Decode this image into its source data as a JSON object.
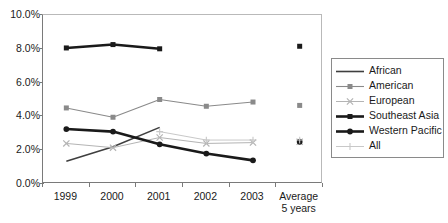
{
  "chart_data": {
    "type": "line",
    "title": "",
    "subtitle": "",
    "xlabel": "",
    "ylabel": "",
    "grid": false,
    "legend_position": "right",
    "categories": [
      "1999",
      "2000",
      "2001",
      "2002",
      "2003",
      "Average 5 years"
    ],
    "category_lines": [
      [
        "1999"
      ],
      [
        "2000"
      ],
      [
        "2001"
      ],
      [
        "2002"
      ],
      [
        "2003"
      ],
      [
        "Average",
        "5 years"
      ]
    ],
    "ylim": [
      0.0,
      10.0
    ],
    "ytick_values": [
      0.0,
      2.0,
      4.0,
      6.0,
      8.0,
      10.0
    ],
    "ytick_labels": [
      "0.0%",
      "2.0%",
      "4.0%",
      "6.0%",
      "8.0%",
      "10.0%"
    ],
    "series": [
      {
        "name": "African",
        "color": "#3f3f3f",
        "width": 1.6,
        "marker": "none",
        "values": [
          1.35,
          2.2,
          3.35,
          null,
          null,
          null
        ]
      },
      {
        "name": "American",
        "color": "#8a8a8a",
        "width": 1.1,
        "marker": "square",
        "values": [
          4.5,
          3.95,
          5.0,
          4.6,
          4.85,
          4.65
        ]
      },
      {
        "name": "European",
        "color": "#b4b4b4",
        "width": 1.0,
        "marker": "cross",
        "values": [
          2.4,
          2.15,
          2.75,
          2.4,
          2.45,
          2.5
        ]
      },
      {
        "name": "Southeast Asia",
        "color": "#1a1a1a",
        "width": 2.6,
        "marker": "square",
        "values": [
          8.05,
          8.25,
          8.0,
          null,
          null,
          8.15
        ]
      },
      {
        "name": "Western Pacific",
        "color": "#1a1a1a",
        "width": 2.6,
        "marker": "circle",
        "values": [
          3.25,
          3.1,
          2.35,
          1.8,
          1.4,
          2.5
        ]
      },
      {
        "name": "All",
        "color": "#c8c8c8",
        "width": 1.0,
        "marker": "plus",
        "values": [
          null,
          null,
          3.1,
          2.6,
          2.6,
          2.6
        ]
      }
    ]
  },
  "legend": {
    "entries": [
      {
        "label": "African"
      },
      {
        "label": "American"
      },
      {
        "label": "European"
      },
      {
        "label": "Southeast Asia"
      },
      {
        "label": "Western Pacific"
      },
      {
        "label": "All"
      }
    ]
  }
}
